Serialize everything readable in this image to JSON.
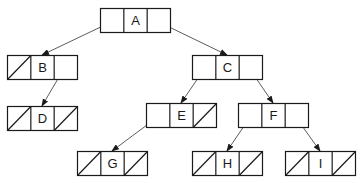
{
  "diagram": {
    "type": "binary-tree-linked-representation",
    "colors": {
      "stroke": "#1a1a1a",
      "edge": "#4a4a4a",
      "background": "#ffffff"
    },
    "nodes": [
      {
        "id": "A",
        "label": "A",
        "x": 100,
        "y": 8,
        "left_null": false,
        "right_null": false
      },
      {
        "id": "B",
        "label": "B",
        "x": 7,
        "y": 55,
        "left_null": true,
        "right_null": false
      },
      {
        "id": "C",
        "label": "C",
        "x": 192,
        "y": 55,
        "left_null": false,
        "right_null": false
      },
      {
        "id": "D",
        "label": "D",
        "x": 7,
        "y": 106,
        "left_null": true,
        "right_null": true
      },
      {
        "id": "E",
        "label": "E",
        "x": 146,
        "y": 103,
        "left_null": false,
        "right_null": true
      },
      {
        "id": "F",
        "label": "F",
        "x": 238,
        "y": 103,
        "left_null": false,
        "right_null": false
      },
      {
        "id": "G",
        "label": "G",
        "x": 77,
        "y": 151,
        "left_null": true,
        "right_null": true
      },
      {
        "id": "H",
        "label": "H",
        "x": 192,
        "y": 151,
        "left_null": true,
        "right_null": true
      },
      {
        "id": "I",
        "label": "I",
        "x": 285,
        "y": 151,
        "left_null": true,
        "right_null": true
      }
    ],
    "edges": [
      {
        "from": "A",
        "side": "left",
        "to": "B"
      },
      {
        "from": "A",
        "side": "right",
        "to": "C"
      },
      {
        "from": "B",
        "side": "right",
        "to": "D"
      },
      {
        "from": "C",
        "side": "left",
        "to": "E"
      },
      {
        "from": "C",
        "side": "right",
        "to": "F"
      },
      {
        "from": "E",
        "side": "left",
        "to": "G"
      },
      {
        "from": "F",
        "side": "left",
        "to": "H"
      },
      {
        "from": "F",
        "side": "right",
        "to": "I"
      }
    ]
  }
}
